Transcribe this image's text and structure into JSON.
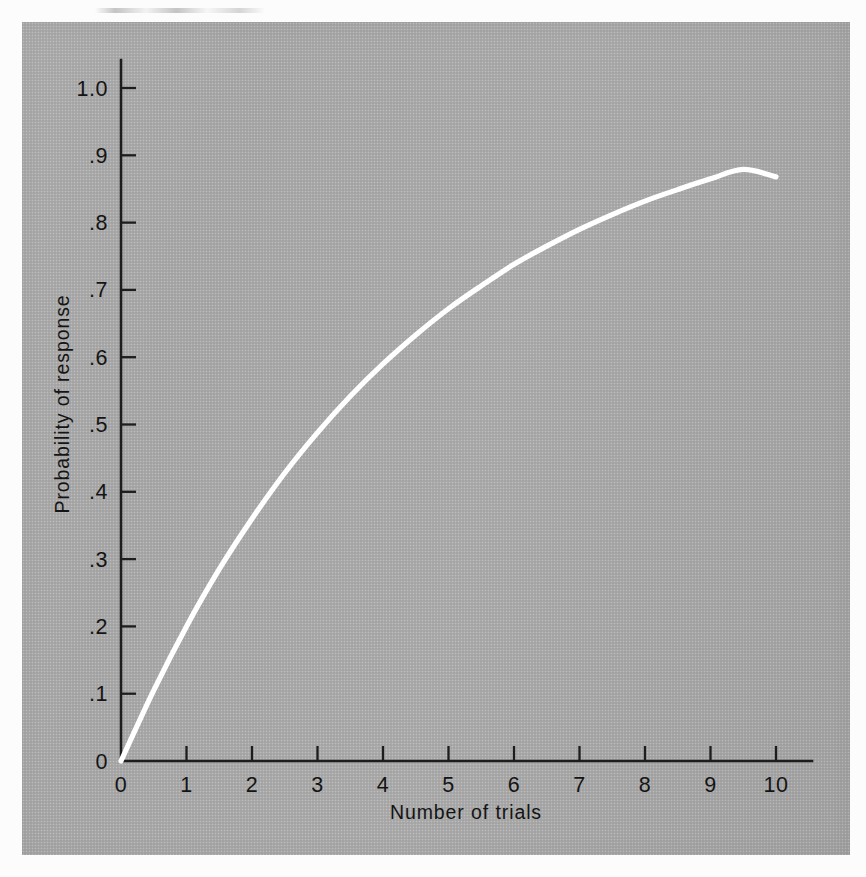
{
  "figure": {
    "plate_color": "#a9a9a9",
    "curve_color": "#ffffff",
    "axis_color": "#1d1d1d",
    "page_background": "#fcfcfc"
  },
  "chart_data": {
    "type": "line",
    "title": "",
    "subtitle": "",
    "xlabel": "Number of trials",
    "ylabel": "Probability of response",
    "xlim": [
      0,
      10
    ],
    "ylim": [
      0,
      1.0
    ],
    "grid": false,
    "legend": null,
    "x_tick_labels": [
      "0",
      "1",
      "2",
      "3",
      "4",
      "5",
      "6",
      "7",
      "8",
      "9",
      "10"
    ],
    "x_tick_values": [
      0,
      1,
      2,
      3,
      4,
      5,
      6,
      7,
      8,
      9,
      10
    ],
    "y_tick_labels": [
      "0",
      ".1",
      ".2",
      ".3",
      ".4",
      ".5",
      ".6",
      ".7",
      ".8",
      ".9",
      "1.0"
    ],
    "y_tick_values": [
      0,
      0.1,
      0.2,
      0.3,
      0.4,
      0.5,
      0.6,
      0.7,
      0.8,
      0.9,
      1.0
    ],
    "series": [
      {
        "name": "Probability of response",
        "x": [
          0,
          0.5,
          1,
          1.5,
          2,
          2.5,
          3,
          3.5,
          4,
          4.5,
          5,
          5.5,
          6,
          6.5,
          7,
          7.5,
          8,
          8.5,
          9,
          9.5,
          10
        ],
        "values": [
          0,
          0.105,
          0.2,
          0.285,
          0.36,
          0.428,
          0.488,
          0.542,
          0.59,
          0.633,
          0.672,
          0.706,
          0.738,
          0.765,
          0.79,
          0.812,
          0.832,
          0.849,
          0.865,
          0.879,
          0.868
        ]
      }
    ],
    "annotations": []
  },
  "axes": {
    "x_title": "Number of trials",
    "y_title": "Probability of response"
  }
}
